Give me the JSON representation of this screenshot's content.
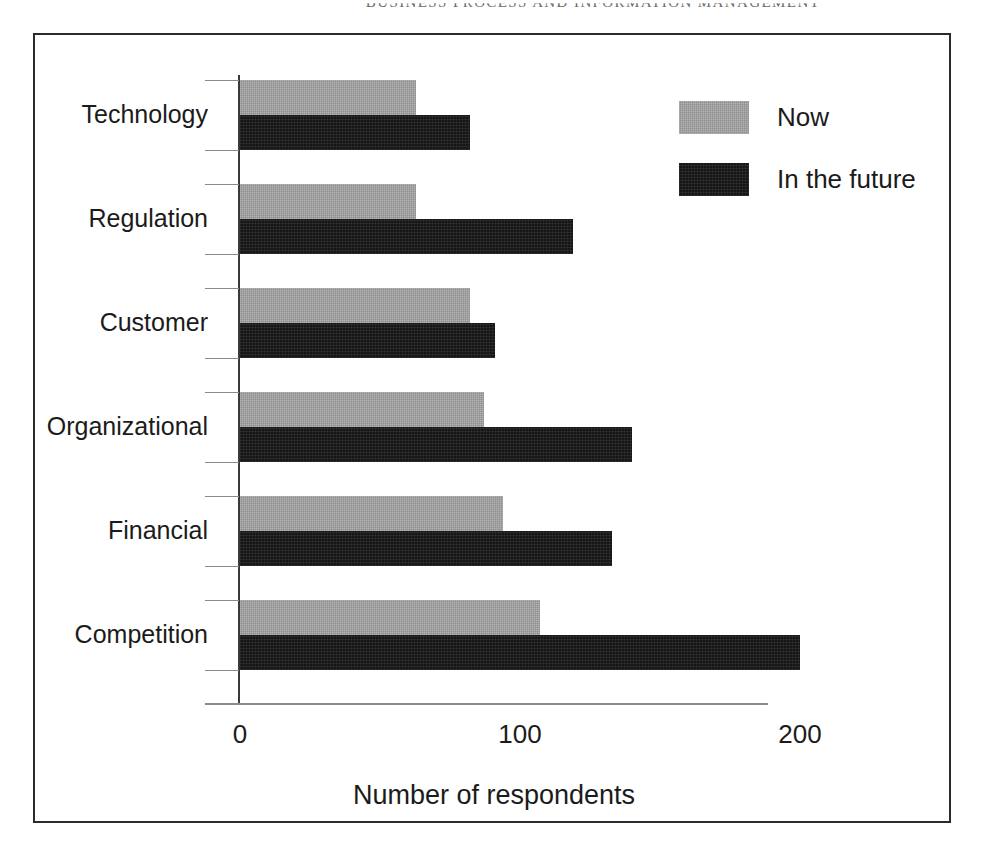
{
  "page": {
    "running_head": "BUSINESS PROCESS AND INFORMATION MANAGEMENT"
  },
  "chart_data": {
    "type": "bar",
    "orientation": "horizontal",
    "title": "",
    "xlabel": "Number of respondents",
    "ylabel": "",
    "xlim": [
      0,
      200
    ],
    "xticks": [
      0,
      100,
      200
    ],
    "xtick_labels": [
      "0",
      "100",
      "200"
    ],
    "grid": false,
    "legend_position": "top-right",
    "categories": [
      "Technology",
      "Regulation",
      "Customer",
      "Organizational",
      "Financial",
      "Competition"
    ],
    "series": [
      {
        "name": "Now",
        "color": "#8f8f8f",
        "values": [
          63,
          63,
          82,
          87,
          94,
          107
        ]
      },
      {
        "name": "In the future",
        "color": "#161616",
        "values": [
          82,
          119,
          91,
          140,
          133,
          200
        ]
      }
    ]
  },
  "legend": {
    "items": [
      {
        "label": "Now",
        "swatch": "now"
      },
      {
        "label": "In the future",
        "swatch": "future"
      }
    ]
  }
}
